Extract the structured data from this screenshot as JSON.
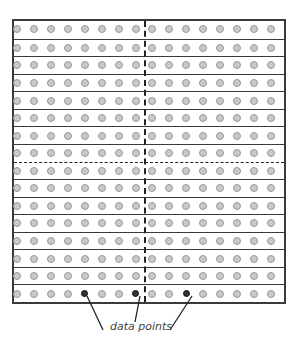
{
  "diagram": {
    "type": "sample-grid",
    "rows": 16,
    "columns": 16,
    "top_labels": [
      "",
      "",
      ""
    ],
    "dashed_dividers": {
      "vertical_after_column": 8,
      "horizontal_after_row": 8
    },
    "highlighted_points": [
      {
        "row": 16,
        "column": 5
      },
      {
        "row": 16,
        "column": 8
      },
      {
        "row": 16,
        "column": 11
      }
    ],
    "annotation_label": "data points",
    "colors": {
      "border": "#3a3a3a",
      "dot_fill": "#c9c9c9",
      "dot_stroke": "#9a9a9a",
      "highlight": "#333333",
      "annotation": "#444444"
    }
  }
}
